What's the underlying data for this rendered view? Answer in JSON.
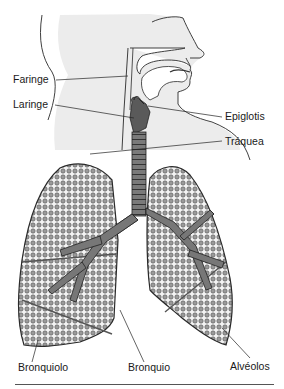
{
  "figure": {
    "colors": {
      "background": "#ffffff",
      "shading": "#ebebeb",
      "airway": "#6e6e6e",
      "alveoli": "#8a8a8a",
      "outline": "#2a2a2a"
    },
    "labels": {
      "faringe": "Faringe",
      "laringe": "Laringe",
      "epiglotis": "Epiglotis",
      "traquea": "Tráquea",
      "bronquiolo": "Bronquiolo",
      "bronquio": "Bronquio",
      "alveolos": "Alvéolos"
    }
  }
}
